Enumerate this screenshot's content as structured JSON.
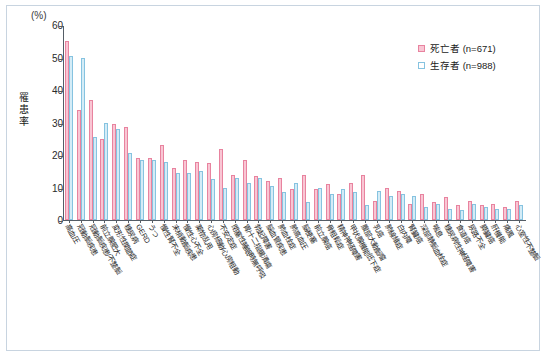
{
  "figure": {
    "unit_label": "(%)",
    "y_axis_title": "罹患率"
  },
  "legend": {
    "position": "top-right",
    "entries": [
      {
        "label": "死亡者 (n=671)",
        "color": "#f9c6d4",
        "border": "#e8839f"
      },
      {
        "label": "生存者 (n=988)",
        "color": "#ffffff",
        "border": "#86c3e0"
      }
    ]
  },
  "chart_data": {
    "type": "bar",
    "title": "",
    "subtitle": "",
    "xlabel": "",
    "ylabel": "罹患率",
    "unit": "%",
    "ylim": [
      0,
      60
    ],
    "yticks": [
      0,
      10,
      20,
      30,
      40,
      50,
      60
    ],
    "grid": false,
    "legend_position": "top-right",
    "categories": [
      "高血圧",
      "冠動脈疾患",
      "冠動脈疾患/不整脈",
      "前立腺肥大",
      "変形性関節症",
      "糖尿病",
      "GERD",
      "うつ",
      "慢性腎不全",
      "末梢動脈疾患",
      "慢性心不全",
      "薬物乱用",
      "心房細動/心房粗動",
      "不安定症",
      "閉塞性睡眠時無呼吸",
      "胃/十二指腸潰瘍",
      "勃起障害",
      "脳血管疾患",
      "肺血栓症",
      "肺高血圧",
      "脳梗塞",
      "前立腺癌",
      "骨粗鬆症",
      "精神神経障害",
      "甲状腺機能低下症",
      "腹部大動脈瘤",
      "乳癌",
      "肺線維症",
      "白内障",
      "腎臓癌",
      "深部静脈血栓症",
      "喘息",
      "糖尿病性神経障害",
      "食道癌",
      "尿路不全",
      "膵臓癌",
      "肝機能",
      "痛風",
      "心室性不整脈"
    ],
    "series": [
      {
        "name": "死亡者 (n=671)",
        "color": "#f9c6d4",
        "border": "#e8839f",
        "values": [
          55,
          34,
          37,
          25,
          29.5,
          28.5,
          19,
          19,
          23,
          16,
          18.5,
          18,
          17.5,
          22,
          14,
          18.5,
          13.5,
          12,
          13,
          9.5,
          14,
          9.5,
          11,
          8,
          11.5,
          14,
          6,
          10,
          9,
          5,
          8,
          5.5,
          7,
          4.5,
          6,
          4.5,
          5,
          4,
          6
        ]
      },
      {
        "name": "生存者 (n=988)",
        "color": "#ffffff",
        "border": "#86c3e0",
        "values": [
          50.5,
          49.8,
          25.5,
          30,
          28,
          20.5,
          18.5,
          18.5,
          18,
          14.5,
          14.5,
          15,
          12.5,
          10,
          13,
          11.5,
          13,
          10.5,
          8.5,
          11.5,
          5.5,
          10,
          8,
          9.5,
          8.5,
          4.5,
          9,
          7.5,
          8,
          7.5,
          4,
          5,
          3.5,
          3,
          5,
          4,
          3.5,
          3.5,
          4.5
        ]
      }
    ]
  }
}
